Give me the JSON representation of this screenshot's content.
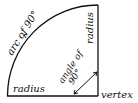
{
  "diagram": {
    "labels": {
      "arc": "arc of 90°",
      "radius_top": "radius",
      "radius_bottom": "radius",
      "angle_line1": "angle of",
      "angle_line2": "90°",
      "vertex": "vertex"
    },
    "colors": {
      "stroke": "#111111",
      "background": "#ffffff"
    }
  }
}
